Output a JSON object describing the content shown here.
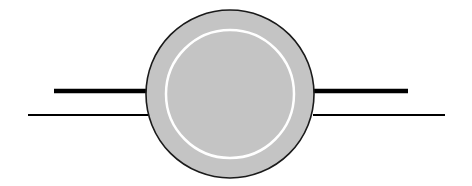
{
  "diagram": {
    "background": "#ffffff",
    "circle": {
      "cx": 230,
      "cy": 94,
      "r": 84,
      "fill": "#c4c4c4",
      "stroke": "#1a1a1a",
      "stroke_width": 1.6
    },
    "inner_ring": {
      "cx": 230,
      "cy": 94,
      "r": 64,
      "stroke": "#ffffff",
      "stroke_width": 2.5
    },
    "lines": [
      {
        "name": "left-thick-line",
        "x1": 54,
        "y1": 91,
        "x2": 150,
        "y2": 91,
        "stroke": "#000000",
        "width": 4.5
      },
      {
        "name": "left-thin-line",
        "x1": 28,
        "y1": 115,
        "x2": 148,
        "y2": 115,
        "stroke": "#000000",
        "width": 2
      },
      {
        "name": "right-thick-line",
        "x1": 312,
        "y1": 91,
        "x2": 408,
        "y2": 91,
        "stroke": "#000000",
        "width": 4.5
      },
      {
        "name": "right-thin-line",
        "x1": 313,
        "y1": 115,
        "x2": 445,
        "y2": 115,
        "stroke": "#000000",
        "width": 2
      }
    ]
  }
}
